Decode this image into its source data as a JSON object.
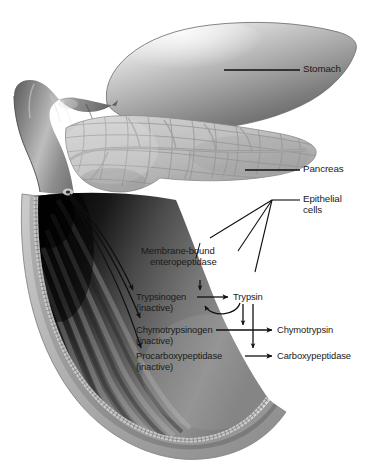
{
  "figure": {
    "title_partial": "Activation of pancreatic proteases in the duodenum",
    "background_color": "#ffffff",
    "ink_color": "#1a1a1a",
    "width": 381,
    "height": 473
  },
  "callouts": [
    {
      "id": "stomach",
      "label": "Stomach",
      "leader": "horizontal-line"
    },
    {
      "id": "pancreas",
      "label": "Pancreas",
      "leader": "horizontal-line"
    },
    {
      "id": "epithelial",
      "label": "Epithelial",
      "label2": "cells",
      "leader": "three-line-fan"
    }
  ],
  "enzyme_label": {
    "line1": "Membrane-bound",
    "line2": "enteropeptidase"
  },
  "cascade": {
    "rows": [
      {
        "zymogen": "Trypsinogen",
        "state": "(inactive)",
        "product": "Trypsin"
      },
      {
        "zymogen": "Chymotrypsinogen",
        "state": "(inactive)",
        "product": "Chymotrypsin"
      },
      {
        "zymogen": "Procarboxypeptidase",
        "state": "(inactive)",
        "product": "Carboxypeptidase"
      }
    ]
  },
  "anatomy": {
    "organs": [
      "stomach",
      "pylorus",
      "duodenum",
      "pancreas"
    ],
    "lumen_feature": "circular folds (plicae circulares)",
    "secretion_arrows": 3
  }
}
